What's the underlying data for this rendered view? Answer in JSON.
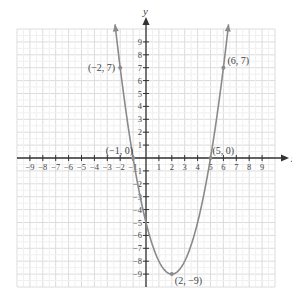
{
  "chart_data": {
    "type": "line",
    "title": "",
    "xlabel": "x",
    "ylabel": "y",
    "xlim": [
      -10,
      10
    ],
    "ylim": [
      -10,
      10
    ],
    "grid": true,
    "x_ticks": [
      -9,
      -8,
      -7,
      -6,
      -5,
      -4,
      -3,
      -2,
      -1,
      1,
      2,
      3,
      4,
      5,
      6,
      7,
      8,
      9
    ],
    "y_ticks": [
      -9,
      -8,
      -7,
      -6,
      -5,
      -4,
      -3,
      -2,
      -1,
      1,
      2,
      3,
      4,
      5,
      6,
      7,
      8,
      9
    ],
    "x_tick_labels": [
      "−9",
      "−8",
      "−7",
      "−6",
      "−5",
      "−4",
      "−3",
      "−2",
      "−1",
      "1",
      "2",
      "3",
      "4",
      "5",
      "6",
      "7",
      "8",
      "9"
    ],
    "y_tick_labels": [
      "−9",
      "−8",
      "−7",
      "−6",
      "−5",
      "−4",
      "−3",
      "−2",
      "−1",
      "1",
      "2",
      "3",
      "4",
      "5",
      "6",
      "7",
      "8",
      "9"
    ],
    "series": [
      {
        "name": "parabola",
        "equation": "y = (x − 2)² − 9",
        "x_range": [
          -2.4,
          6.4
        ],
        "points": [
          {
            "x": -2,
            "y": 7
          },
          {
            "x": -1,
            "y": 0
          },
          {
            "x": 0,
            "y": -5
          },
          {
            "x": 2,
            "y": -9
          },
          {
            "x": 5,
            "y": 0
          },
          {
            "x": 6,
            "y": 7
          }
        ]
      }
    ],
    "annotations": [
      {
        "label": "(−2, 7)",
        "x": -2,
        "y": 7
      },
      {
        "label": "(−1, 0)",
        "x": -1,
        "y": 0
      },
      {
        "label": "(5, 0)",
        "x": 5,
        "y": 0
      },
      {
        "label": "(6, 7)",
        "x": 6,
        "y": 7
      },
      {
        "label": "(2, −9)",
        "x": 2,
        "y": -9
      }
    ],
    "colors": {
      "grid": "#dcdcdc",
      "axis": "#333333",
      "curve": "#8a8a8a",
      "text": "#444444"
    }
  }
}
